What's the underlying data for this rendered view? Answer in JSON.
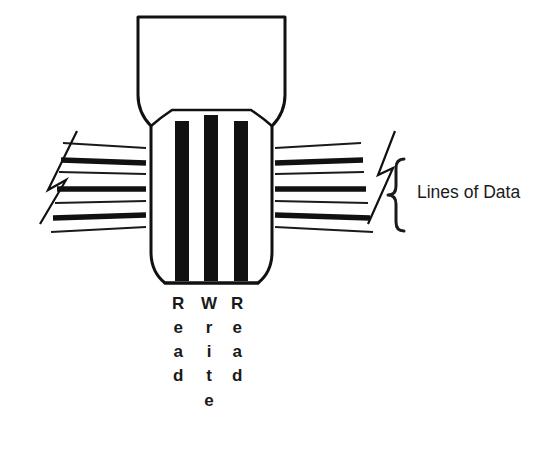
{
  "diagram": {
    "colors": {
      "ink": "#111111",
      "background": "#ffffff",
      "gap_bar": "#111111",
      "thick_line": "#111111",
      "thin_line": "#1a1a1a"
    },
    "head": {
      "name": "read-write-head",
      "top_width": 160,
      "body_width": 130
    },
    "gaps": [
      {
        "id": "gap-read-1",
        "label": "Read",
        "letters": [
          "R",
          "e",
          "a",
          "d"
        ],
        "x_center": 182
      },
      {
        "id": "gap-write",
        "label": "Write",
        "letters": [
          "W",
          "r",
          "i",
          "t",
          "e"
        ],
        "x_center": 211
      },
      {
        "id": "gap-read-2",
        "label": "Read",
        "letters": [
          "R",
          "e",
          "a",
          "d"
        ],
        "x_center": 241
      }
    ],
    "data_lines": {
      "name": "lines-of-data",
      "count": 4,
      "thin_boundary_count": 2,
      "break_symbol": "zigzag",
      "left_break": true,
      "right_break": true
    },
    "annotation": {
      "brace": "}",
      "text": "Lines of Data"
    }
  }
}
